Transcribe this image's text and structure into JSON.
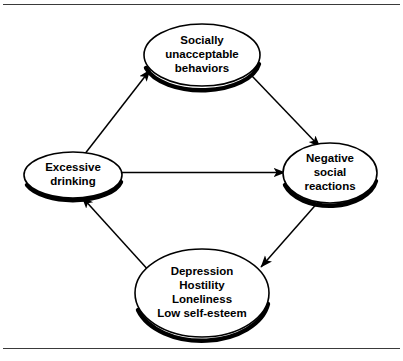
{
  "figure": {
    "background_color": "#ffffff",
    "line_color": "#000000",
    "rule_color": "#3a3a3a",
    "width": 403,
    "height": 361
  },
  "nodes": [
    {
      "id": "socially-unacceptable-behaviors",
      "lines": [
        "Socially",
        "unacceptable",
        "behaviors"
      ],
      "line1": "Socially",
      "line2": "unacceptable",
      "line3": "behaviors",
      "cx": 202,
      "cy": 55,
      "rx": 58,
      "ry": 31
    },
    {
      "id": "negative-social-reactions",
      "lines": [
        "Negative",
        "social",
        "reactions"
      ],
      "line1": "Negative",
      "line2": "social",
      "line3": "reactions",
      "cx": 330,
      "cy": 173,
      "rx": 47,
      "ry": 30
    },
    {
      "id": "depression-hostility-loneliness-low-self-esteem",
      "lines": [
        "Depression",
        "Hostility",
        "Loneliness",
        "Low self-esteem"
      ],
      "line1": "Depression",
      "line2": "Hostility",
      "line3": "Loneliness",
      "line4": "Low self-esteem",
      "cx": 202,
      "cy": 293,
      "rx": 67,
      "ry": 44
    },
    {
      "id": "excessive-drinking",
      "lines": [
        "Excessive",
        "drinking"
      ],
      "line1": "Excessive",
      "line2": "drinking",
      "cx": 73,
      "cy": 175,
      "rx": 49,
      "ry": 23
    }
  ],
  "edges": [
    {
      "id": "drinking-to-behaviors",
      "from": "excessive-drinking",
      "to": "socially-unacceptable-behaviors",
      "arrows": "single",
      "direction": "up-right"
    },
    {
      "id": "behaviors-to-reactions",
      "from": "socially-unacceptable-behaviors",
      "to": "negative-social-reactions",
      "arrows": "single",
      "direction": "down-right"
    },
    {
      "id": "reactions-to-feelings",
      "from": "negative-social-reactions",
      "to": "depression-hostility-loneliness-low-self-esteem",
      "arrows": "single",
      "direction": "down-left"
    },
    {
      "id": "feelings-to-drinking",
      "from": "depression-hostility-loneliness-low-self-esteem",
      "to": "excessive-drinking",
      "arrows": "single",
      "direction": "up-left"
    },
    {
      "id": "drinking-reactions-bidirectional",
      "from": "excessive-drinking",
      "to": "negative-social-reactions",
      "arrows": "double",
      "direction": "horizontal"
    }
  ]
}
